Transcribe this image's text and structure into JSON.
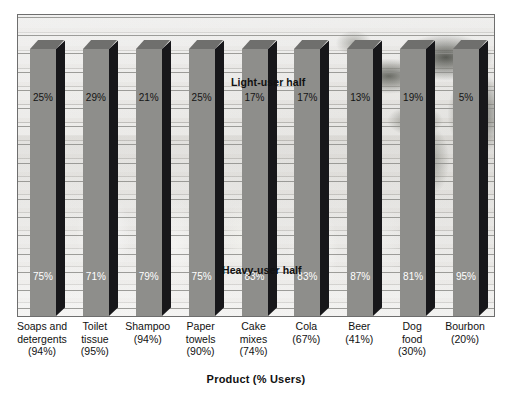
{
  "chart_data": {
    "type": "bar",
    "title": "",
    "subtitle": "",
    "xlabel": "Product (% Users)",
    "ylabel": "",
    "ylim": [
      0,
      100
    ],
    "grid": true,
    "stacked": true,
    "legend_position": "in-plot-annotations",
    "annotations": [
      {
        "id": "light",
        "text": "Light-user half"
      },
      {
        "id": "heavy",
        "text": "Heavy-user half"
      }
    ],
    "categories": [
      "Soaps and detergents",
      "Toilet tissue",
      "Shampoo",
      "Paper towels",
      "Cake mixes",
      "Cola",
      "Beer",
      "Dog food",
      "Bourbon"
    ],
    "category_sublabels": [
      "(94%)",
      "(95%)",
      "(94%)",
      "(90%)",
      "(74%)",
      "(67%)",
      "(41%)",
      "(30%)",
      "(20%)"
    ],
    "series": [
      {
        "name": "Light-user half",
        "values": [
          25,
          29,
          21,
          25,
          17,
          17,
          13,
          19,
          5
        ]
      },
      {
        "name": "Heavy-user half",
        "values": [
          75,
          71,
          79,
          75,
          83,
          83,
          87,
          81,
          95
        ]
      }
    ],
    "value_labels_light": [
      "25%",
      "29%",
      "21%",
      "25%",
      "17%",
      "17%",
      "13%",
      "19%",
      "5%"
    ],
    "value_labels_heavy": [
      "75%",
      "71%",
      "79%",
      "75%",
      "83%",
      "83%",
      "87%",
      "81%",
      "95%"
    ],
    "colors": {
      "bar_face": "#8e8e8b",
      "bar_top": "#6f6f6d",
      "bar_side": "#17171a",
      "gridline": "#8d8d8a",
      "plot_border": "#6e6e6e",
      "label_light": "#141414",
      "label_heavy": "#ffffff",
      "page_background": "#ffffff"
    }
  },
  "categories_multiline": [
    {
      "line1": "Soaps and",
      "line2": "detergents",
      "line3": "(94%)"
    },
    {
      "line1": "Toilet",
      "line2": "tissue",
      "line3": "(95%)"
    },
    {
      "line1": "Shampoo",
      "line2": "(94%)",
      "line3": ""
    },
    {
      "line1": "Paper",
      "line2": "towels",
      "line3": "(90%)"
    },
    {
      "line1": "Cake",
      "line2": "mixes",
      "line3": "(74%)"
    },
    {
      "line1": "Cola",
      "line2": "(67%)",
      "line3": ""
    },
    {
      "line1": "Beer",
      "line2": "(41%)",
      "line3": ""
    },
    {
      "line1": "Dog",
      "line2": "food",
      "line3": "(30%)"
    },
    {
      "line1": "Bourbon",
      "line2": "(20%)",
      "line3": ""
    }
  ]
}
